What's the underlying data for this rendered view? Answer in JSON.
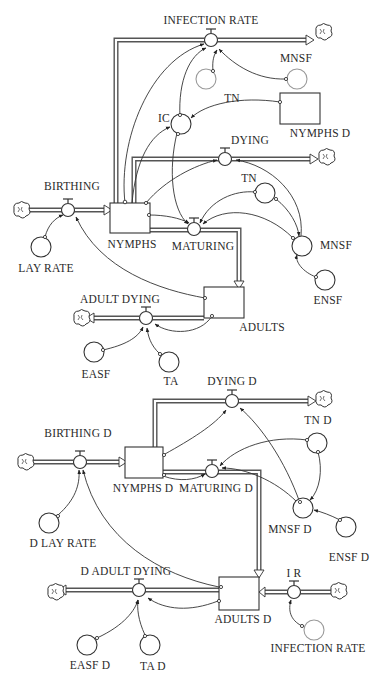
{
  "diagram": {
    "type": "stock-and-flow",
    "upper_model": {
      "stocks": [
        {
          "id": "nymphs",
          "label": "NYMPHS"
        },
        {
          "id": "adults",
          "label": "ADULTS"
        },
        {
          "id": "nymphs_d_ref",
          "label": "NYMPHS D"
        }
      ],
      "flows": [
        {
          "id": "infection_rate",
          "label": "INFECTION RATE"
        },
        {
          "id": "dying",
          "label": "DYING"
        },
        {
          "id": "birthing",
          "label": "BIRTHING"
        },
        {
          "id": "maturing",
          "label": "MATURING"
        },
        {
          "id": "adult_dying",
          "label": "ADULT DYING"
        }
      ],
      "converters": [
        {
          "id": "tn_top",
          "label": "TN"
        },
        {
          "id": "mnsf_top",
          "label": "MNSF"
        },
        {
          "id": "ic",
          "label": "IC"
        },
        {
          "id": "tn",
          "label": "TN"
        },
        {
          "id": "mnsf",
          "label": "MNSF"
        },
        {
          "id": "ensf",
          "label": "ENSF"
        },
        {
          "id": "lay_rate",
          "label": "LAY RATE"
        },
        {
          "id": "easf",
          "label": "EASF"
        },
        {
          "id": "ta",
          "label": "TA"
        }
      ]
    },
    "lower_model": {
      "stocks": [
        {
          "id": "nymphs_d",
          "label": "NYMPHS D"
        },
        {
          "id": "adults_d",
          "label": "ADULTS D"
        }
      ],
      "flows": [
        {
          "id": "dying_d",
          "label": "DYING D"
        },
        {
          "id": "birthing_d",
          "label": "BIRTHING D"
        },
        {
          "id": "maturing_d",
          "label": "MATURING D"
        },
        {
          "id": "d_adult_dying",
          "label": "D ADULT DYING"
        },
        {
          "id": "i_r",
          "label": "I R"
        }
      ],
      "converters": [
        {
          "id": "tn_d",
          "label": "TN D"
        },
        {
          "id": "mnsf_d",
          "label": "MNSF D"
        },
        {
          "id": "ensf_d",
          "label": "ENSF D"
        },
        {
          "id": "d_lay_rate",
          "label": "D LAY RATE"
        },
        {
          "id": "easf_d",
          "label": "EASF D"
        },
        {
          "id": "ta_d",
          "label": "TA D"
        },
        {
          "id": "infection_rate_ref",
          "label": "INFECTION RATE"
        }
      ]
    }
  }
}
